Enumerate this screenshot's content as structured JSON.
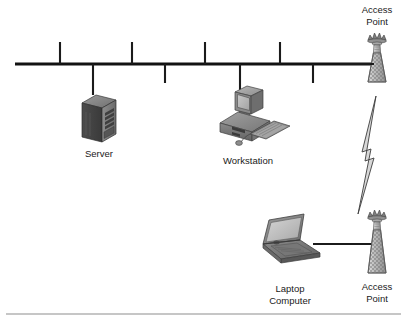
{
  "diagram": {
    "background_color": "#ffffff",
    "line_color": "#1b1b1b",
    "footer_rule_color": "#8e8e8e",
    "backbone": {
      "name": "bus-backbone-cable",
      "x_start": 15,
      "x_end": 371,
      "y": 64,
      "up_taps_x": [
        60,
        132,
        205,
        280
      ],
      "up_tap_top_y": 42,
      "down_taps_x": [
        93,
        165,
        240,
        313
      ],
      "down_tap_bottom_y": 83
    },
    "nodes": [
      {
        "id": "access-point-top",
        "icon": "radio-tower-icon",
        "label_lines": [
          "Access",
          "Point"
        ],
        "label_x": 377,
        "label_y_lines": [
          13,
          25
        ],
        "icon_x": 377,
        "icon_y": 38,
        "connection": "wired-to-backbone"
      },
      {
        "id": "server",
        "icon": "server-tower-icon",
        "label_lines": [
          "Server"
        ],
        "label_x": 99,
        "label_y_lines": [
          157
        ],
        "icon_x": 99,
        "icon_y": 95,
        "connection": "drop-from-backbone"
      },
      {
        "id": "workstation",
        "icon": "desktop-computer-icon",
        "label_lines": [
          "Workstation"
        ],
        "label_x": 248,
        "label_y_lines": [
          164
        ],
        "icon_x": 248,
        "icon_y": 95,
        "connection": "drop-from-backbone"
      },
      {
        "id": "laptop-computer",
        "icon": "laptop-icon",
        "label_lines": [
          "Laptop",
          "Computer"
        ],
        "label_x": 290,
        "label_y_lines": [
          292,
          304
        ],
        "icon_x": 290,
        "icon_y": 222,
        "connection": "wired-to-access-point-bottom"
      },
      {
        "id": "access-point-bottom",
        "icon": "radio-tower-icon",
        "label_lines": [
          "Access",
          "Point"
        ],
        "label_x": 377,
        "label_y_lines": [
          290,
          302
        ],
        "icon_x": 377,
        "icon_y": 215,
        "connection": "wireless-bridge"
      }
    ],
    "links": [
      {
        "id": "wireless-bridge-link",
        "type": "lightning-bolt",
        "from": "access-point-top",
        "to": "access-point-bottom",
        "color": "#d8d8d8",
        "outline": "#3d3d3d"
      },
      {
        "id": "laptop-to-ap-cable",
        "type": "straight-cable",
        "from": "laptop-computer",
        "to": "access-point-bottom",
        "x_start": 313,
        "x_end": 371,
        "y": 244
      },
      {
        "id": "ap-to-backbone-cable",
        "type": "straight-cable",
        "from": "access-point-top",
        "to": "bus-backbone-cable",
        "x_start": 340,
        "x_end": 374,
        "y": 64
      }
    ],
    "footer_rule": {
      "name": "footer-divider",
      "x_start": 6,
      "x_end": 401,
      "y": 314
    }
  }
}
